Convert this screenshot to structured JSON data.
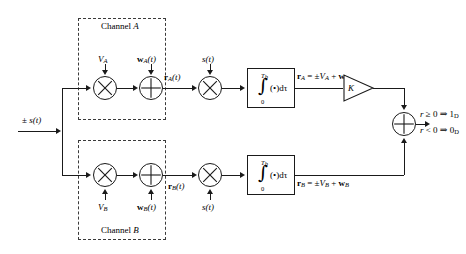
{
  "diagram": {
    "background": "#ffffff",
    "line_color": "#1a1a1a",
    "dash_color": "#3a3a3a",
    "input": {
      "label_pm": "±",
      "label_s": "s",
      "label_t": "(t)"
    },
    "channel_a": {
      "box_label_pre": "Channel ",
      "box_label_id": "A",
      "gain_label": "V",
      "gain_sub": "A",
      "noise_label": "w",
      "noise_sub": "A",
      "noise_time": "(t)",
      "out_label": "r",
      "out_sub": "A",
      "out_time": "(t)",
      "mult_icon": "multiply-circle-icon",
      "add_icon": "plus-circle-icon"
    },
    "channel_b": {
      "box_label_pre": "Channel ",
      "box_label_id": "B",
      "gain_label": "V",
      "gain_sub": "B",
      "noise_label": "w",
      "noise_sub": "B",
      "noise_time": "(t)",
      "out_label": "r",
      "out_sub": "B",
      "out_time": "(t)"
    },
    "correlator_a": {
      "ref_label": "s",
      "ref_time": "(t)"
    },
    "correlator_b": {
      "ref_label": "s",
      "ref_time": "(t)"
    },
    "integrator": {
      "upper_limit": "T",
      "upper_limit_sub": "b",
      "lower_limit": "0",
      "sign": "∫",
      "expr": "(•)dτ"
    },
    "result_a": {
      "vec": "r",
      "vec_sub": "A",
      "eq": " = ",
      "pm": "±",
      "v": "V",
      "v_sub": "A",
      "plus": " + ",
      "w": "w",
      "w_sub": "A"
    },
    "result_b": {
      "vec": "r",
      "vec_sub": "B",
      "eq": " = ",
      "pm": "±",
      "v": "V",
      "v_sub": "B",
      "plus": " + ",
      "w": "w",
      "w_sub": "B"
    },
    "amplifier": {
      "gain": "K",
      "icon": "triangle-amplifier-icon"
    },
    "summer": {
      "icon": "plus-circle-icon"
    },
    "decision": {
      "rule_hi_var": "r",
      "rule_hi_op": " ≥ 0 ⇒ 1",
      "rule_hi_sub": "D",
      "rule_lo_var": "r",
      "rule_lo_op": " < 0 ⇒ 0",
      "rule_lo_sub": "D"
    }
  }
}
